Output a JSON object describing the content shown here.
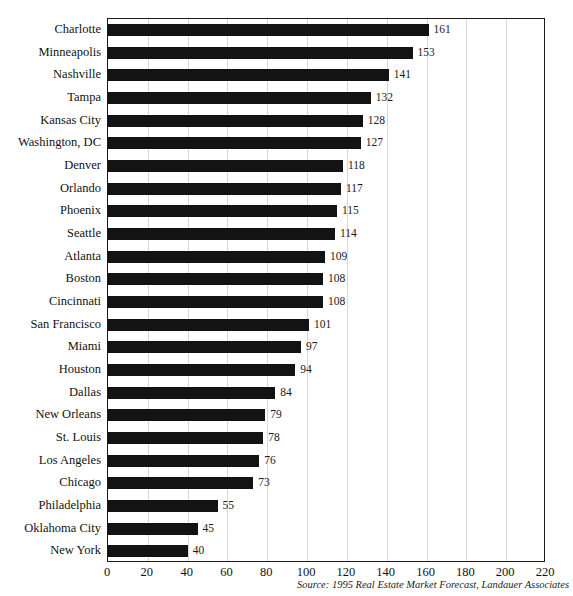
{
  "title_sliver": "",
  "source": "Source: 1995 Real Estate Market Forecast, Landauer Associates",
  "axis": {
    "ticks": [
      "0",
      "20",
      "40",
      "60",
      "80",
      "100",
      "120",
      "140",
      "160",
      "180",
      "200",
      "220"
    ]
  },
  "colors": {
    "bar": "#131313",
    "gridline": "#d8d8d8",
    "border": "#1a1a1a",
    "text": "#121212"
  },
  "chart_data": {
    "type": "bar",
    "orientation": "horizontal",
    "title": "",
    "xlabel": "",
    "ylabel": "",
    "xlim": [
      0,
      220
    ],
    "xticks": [
      0,
      20,
      40,
      60,
      80,
      100,
      120,
      140,
      160,
      180,
      200,
      220
    ],
    "grid": true,
    "legend": false,
    "source": "Source: 1995 Real Estate Market Forecast, Landauer Associates",
    "categories": [
      "Charlotte",
      "Minneapolis",
      "Nashville",
      "Tampa",
      "Kansas City",
      "Washington, DC",
      "Denver",
      "Orlando",
      "Phoenix",
      "Seattle",
      "Atlanta",
      "Boston",
      "Cincinnati",
      "San Francisco",
      "Miami",
      "Houston",
      "Dallas",
      "New Orleans",
      "St. Louis",
      "Los Angeles",
      "Chicago",
      "Philadelphia",
      "Oklahoma City",
      "New York"
    ],
    "values": [
      161,
      153,
      141,
      132,
      128,
      127,
      118,
      117,
      115,
      114,
      109,
      108,
      108,
      101,
      97,
      94,
      84,
      79,
      78,
      76,
      73,
      55,
      45,
      40
    ],
    "data_labels": [
      "161",
      "153",
      "141",
      "132",
      "128",
      "127",
      "118",
      "117",
      "115",
      "114",
      "109",
      "108",
      "108",
      "101",
      "97",
      "94",
      "84",
      "79",
      "78",
      "76",
      "73",
      "55",
      "45",
      "40"
    ]
  }
}
